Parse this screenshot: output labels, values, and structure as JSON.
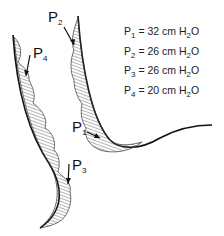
{
  "figure": {
    "labels": [
      {
        "id": "P1",
        "text": "P",
        "sub": "1"
      },
      {
        "id": "P2",
        "text": "P",
        "sub": "2"
      },
      {
        "id": "P3",
        "text": "P",
        "sub": "3"
      },
      {
        "id": "P4",
        "text": "P",
        "sub": "4"
      }
    ]
  },
  "legend": {
    "rows": [
      {
        "name": "P",
        "sub": "1",
        "value": "= 32 cm H",
        "unit_sub": "2",
        "unit_end": "O"
      },
      {
        "name": "P",
        "sub": "2",
        "value": "= 26 cm H",
        "unit_sub": "2",
        "unit_end": "O"
      },
      {
        "name": "P",
        "sub": "3",
        "value": "= 26 cm H",
        "unit_sub": "2",
        "unit_end": "O"
      },
      {
        "name": "P",
        "sub": "4",
        "value": "= 20 cm H",
        "unit_sub": "2",
        "unit_end": "O"
      }
    ]
  }
}
